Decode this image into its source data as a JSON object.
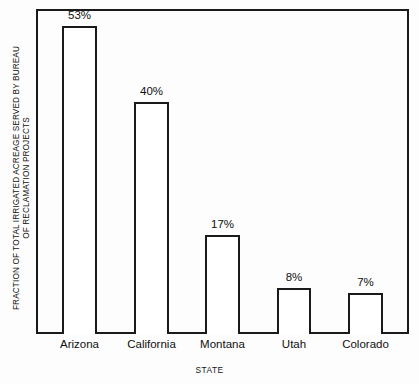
{
  "chart_data": {
    "type": "bar",
    "title": "",
    "categories": [
      "Arizona",
      "California",
      "Montana",
      "Utah",
      "Colorado"
    ],
    "values": [
      53,
      40,
      17,
      8,
      7
    ],
    "value_labels": [
      "53%",
      "40%",
      "17%",
      "8%",
      "7%"
    ],
    "xlabel": "STATE",
    "ylabel": "FRACTION OF TOTAL IRRIGATED ACREAGE SERVED BY BUREAU OF RECLAMATION PROJECTS",
    "ylabel_lines": [
      "FRACTION OF TOTAL IRRIGATED ACREAGE SERVED BY BUREAU",
      "OF RECLAMATION PROJECTS"
    ],
    "ylim": [
      0,
      56
    ],
    "grid": false,
    "legend": null,
    "bar_fill_color": "#ffffff",
    "bar_outline_color": "#1a1a1a",
    "frame_color": "#1a1a1a",
    "background_color": "#fdfdfd"
  }
}
